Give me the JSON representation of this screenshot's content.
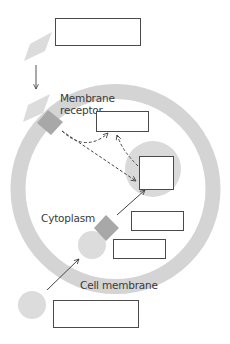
{
  "diagram": {
    "type": "cell signaling pathway worksheet",
    "labels": {
      "membrane_receptor_line1": "Membrane",
      "membrane_receptor_line2": "receptor",
      "cytoplasm": "Cytoplasm",
      "cell_membrane": "Cell membrane"
    },
    "answer_boxes": [
      {
        "id": "box-signal",
        "value": ""
      },
      {
        "id": "box-second-messenger",
        "value": ""
      },
      {
        "id": "box-nucleus",
        "value": ""
      },
      {
        "id": "box-response-1",
        "value": ""
      },
      {
        "id": "box-response-2",
        "value": ""
      },
      {
        "id": "box-outer-molecule",
        "value": ""
      }
    ],
    "colors": {
      "membrane": "#d4d4d4",
      "receptor": "#a8a8a8",
      "signal_molecule": "#dcdcdc",
      "nucleus": "#dadada",
      "arrow": "#444444",
      "box_border": "#4a4a4a",
      "text": "#3a3a3a"
    }
  }
}
